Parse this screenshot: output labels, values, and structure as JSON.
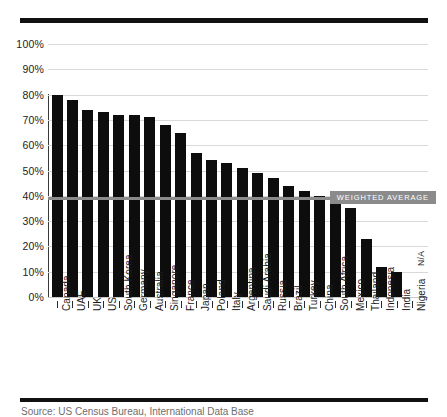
{
  "chart_data": {
    "type": "bar",
    "title": "",
    "subtitle": "",
    "xlabel": "",
    "ylabel": "",
    "ylim": [
      0,
      100
    ],
    "grid": true,
    "legend_position": "none",
    "value_suffix": "%",
    "categories": [
      "Canada",
      "UAE",
      "UK",
      "US",
      "South Korea",
      "Germany",
      "Australia",
      "Singapore",
      "France",
      "Japan",
      "Poland",
      "Italy",
      "Argentina",
      "Saudi Arabia",
      "Russia",
      "Brazil",
      "Turkey",
      "China",
      "South Africa",
      "Mexico",
      "Thailand",
      "Indonesia",
      "India",
      "Nigeria"
    ],
    "values": [
      80,
      78,
      74,
      73,
      72,
      72,
      71,
      68,
      65,
      57,
      54,
      53,
      51,
      49,
      47,
      44,
      42,
      40,
      39,
      35,
      23,
      12,
      10,
      null
    ],
    "value_labels": [
      "80%",
      "78%",
      "74%",
      "73%",
      "72%",
      "72%",
      "71%",
      "68%",
      "65%",
      "57%",
      "54%",
      "53%",
      "51%",
      "49%",
      "47%",
      "44%",
      "42%",
      "40%",
      "39%",
      "35%",
      "23%",
      "12%",
      "10%",
      "N/A"
    ],
    "yticks": [
      0,
      10,
      20,
      30,
      40,
      50,
      60,
      70,
      80,
      90,
      100
    ],
    "ytick_labels": [
      "0%",
      "10%",
      "20%",
      "30%",
      "40%",
      "50%",
      "60%",
      "70%",
      "80%",
      "90%",
      "100%"
    ],
    "annotations": [
      {
        "name": "weighted-average",
        "label": "WEIGHTED AVERAGE",
        "value": 39,
        "type": "hline"
      }
    ],
    "missing_label": "N/A",
    "missing_categories": [
      "Nigeria"
    ],
    "colors": {
      "bar": "#0d0d0d",
      "average_line": "#8b8b8b",
      "average_badge_bg": "#8b8b8b",
      "average_badge_text": "#ffffff",
      "gridline": "#d9d9d9",
      "axis": "#3a3a3a",
      "background": "#ffffff",
      "rule": "#111111"
    }
  },
  "footer": {
    "source_text": "Source: US Census Bureau, International Data Base"
  }
}
